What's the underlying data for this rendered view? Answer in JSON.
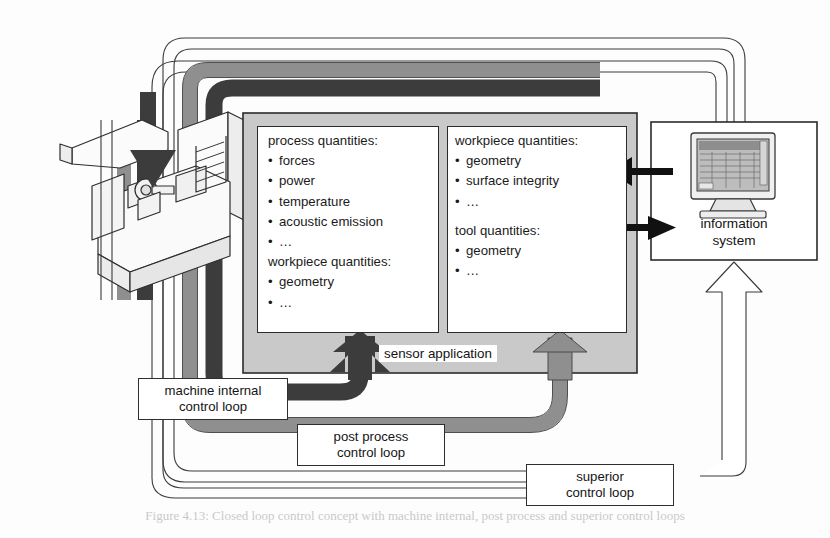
{
  "figure": {
    "caption": "Figure 4.13: Closed loop control concept with machine internal, post process and superior control loops"
  },
  "colors": {
    "panel_fill": "#c9c9c9",
    "panel_stroke": "#2b2b2b",
    "dark_loop": "#3c3c3c",
    "mid_loop": "#8f8f8f",
    "light_loop": "#ffffff",
    "text": "#141414",
    "machine_fill": "#f2f2f2",
    "screen_fill": "#b8b8b8"
  },
  "panels": {
    "left": {
      "name": "process and workpiece quantities",
      "groups": [
        {
          "heading": "process quantities:",
          "items": [
            "forces",
            "power",
            "temperature",
            "acoustic emission",
            "…"
          ]
        },
        {
          "heading": "workpiece quantities:",
          "items": [
            "geometry",
            "…"
          ]
        }
      ]
    },
    "right": {
      "name": "workpiece and tool quantities",
      "groups": [
        {
          "heading": "workpiece quantities:",
          "items": [
            "geometry",
            "surface integrity",
            "…"
          ]
        },
        {
          "heading": "tool quantities:",
          "items": [
            "geometry",
            "…"
          ]
        }
      ]
    }
  },
  "labels": {
    "sensor_application": "sensor application",
    "machine_internal_control_loop": "machine internal\ncontrol loop",
    "machine_internal_line1": "machine internal",
    "machine_internal_line2": "control loop",
    "post_process_line1": "post process",
    "post_process_line2": "control loop",
    "superior_line1": "superior",
    "superior_line2": "control loop",
    "information_system_line1": "information",
    "information_system_line2": "system"
  },
  "icons": {
    "machine_tool": "machine-tool-icon",
    "computer": "computer-monitor-icon",
    "arrow_up_dark": "arrow-up-dark-icon",
    "arrow_up_gray": "arrow-up-gray-icon",
    "arrow_up_white": "arrow-up-white-icon",
    "arrow_left_black": "arrow-left-black-icon",
    "arrow_right_black": "arrow-right-black-icon",
    "arrow_down_dark": "arrow-down-dark-icon"
  },
  "flows": [
    {
      "name": "machine-internal-control-loop",
      "color": "#3c3c3c",
      "from": "sensor application",
      "to": "machine tool"
    },
    {
      "name": "post-process-control-loop",
      "color": "#8f8f8f",
      "from": "sensor application",
      "to": "machine tool"
    },
    {
      "name": "superior-control-loop",
      "color": "#ffffff",
      "from": "information system",
      "to": "machine tool"
    }
  ]
}
